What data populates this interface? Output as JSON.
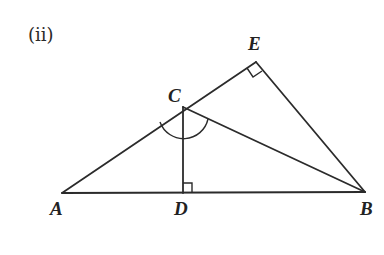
{
  "figure": {
    "caption": "(ii)",
    "vertices": {
      "A": {
        "label": "A",
        "x": 62,
        "y": 193
      },
      "B": {
        "label": "B",
        "x": 365,
        "y": 192
      },
      "C": {
        "label": "C",
        "x": 183,
        "y": 107
      },
      "D": {
        "label": "D",
        "x": 183,
        "y": 193
      },
      "E": {
        "label": "E",
        "x": 256,
        "y": 62
      }
    },
    "segments": [
      "AB",
      "AE",
      "EB",
      "CB",
      "CD"
    ],
    "right_angles": [
      "E",
      "D"
    ],
    "angle_marks": [
      "ACB (arc at C)"
    ],
    "colors": {
      "ink": "#2b2b2b",
      "background": "#ffffff"
    }
  }
}
